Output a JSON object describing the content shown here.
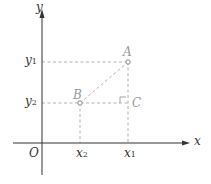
{
  "diagram": {
    "axes": {
      "x_label": "x",
      "y_label": "y",
      "origin_label": "O"
    },
    "points": [
      {
        "name": "A",
        "label": "A",
        "coords": [
          "x1",
          "y1"
        ]
      },
      {
        "name": "B",
        "label": "B",
        "coords": [
          "x2",
          "y2"
        ]
      },
      {
        "name": "C",
        "label": "C",
        "coords": [
          "x1",
          "y2"
        ],
        "right_angle": true
      }
    ],
    "tick_labels": {
      "x": [
        {
          "base": "x",
          "sub": "2"
        },
        {
          "base": "x",
          "sub": "1"
        }
      ],
      "y": [
        {
          "base": "y",
          "sub": "1"
        },
        {
          "base": "y",
          "sub": "2"
        }
      ]
    },
    "colors": {
      "axes": "#333333",
      "dashed": "#aaaaaa",
      "point_labels": "#999999",
      "text": "#333333"
    }
  }
}
